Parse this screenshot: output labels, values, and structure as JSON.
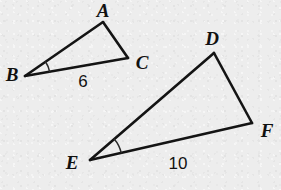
{
  "figure": {
    "type": "geometry-diagram",
    "background_color": "#ededed",
    "ink_color": "#141414",
    "canvas": {
      "width": 281,
      "height": 190
    },
    "triangles": [
      {
        "name": "triangle-abc",
        "vertices": [
          {
            "id": "A",
            "label": "A",
            "x": 103,
            "y": 22,
            "label_x": 103,
            "label_y": 10
          },
          {
            "id": "B",
            "label": "B",
            "x": 25,
            "y": 76,
            "label_x": 12,
            "label_y": 74
          },
          {
            "id": "C",
            "label": "C",
            "x": 128,
            "y": 58,
            "label_x": 142,
            "label_y": 62
          }
        ],
        "marked_angle": {
          "at": "B",
          "radius": 25,
          "start_deg": -35,
          "end_deg": -10
        },
        "side_labels": [
          {
            "id": "BC",
            "between": "B-C",
            "value": "6",
            "x": 83,
            "y": 81
          }
        ]
      },
      {
        "name": "triangle-def",
        "vertices": [
          {
            "id": "D",
            "label": "D",
            "x": 214,
            "y": 53,
            "label_x": 212,
            "label_y": 38
          },
          {
            "id": "E",
            "label": "E",
            "x": 90,
            "y": 160,
            "label_x": 72,
            "label_y": 162
          },
          {
            "id": "F",
            "label": "F",
            "x": 252,
            "y": 123,
            "label_x": 267,
            "label_y": 130
          }
        ],
        "marked_angle": {
          "at": "E",
          "radius": 32,
          "start_deg": -41,
          "end_deg": -13
        },
        "side_labels": [
          {
            "id": "EF",
            "between": "E-F",
            "value": "10",
            "x": 178,
            "y": 163
          }
        ]
      }
    ]
  }
}
